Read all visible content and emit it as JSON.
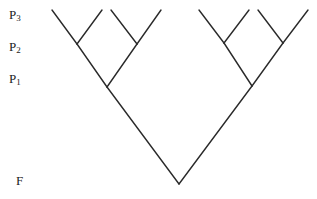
{
  "diagram": {
    "type": "binary-tree",
    "line_color": "#2a2a2a",
    "labels": [
      {
        "id": "p3",
        "base": "P",
        "sub": "3",
        "x": 9,
        "y": 8
      },
      {
        "id": "p2",
        "base": "P",
        "sub": "2",
        "x": 9,
        "y": 40
      },
      {
        "id": "p1",
        "base": "P",
        "sub": "1",
        "x": 9,
        "y": 72
      },
      {
        "id": "f",
        "base": "F",
        "sub": "",
        "x": 16,
        "y": 174
      }
    ],
    "nodes": {
      "root": [
        179,
        184
      ],
      "p1_left": [
        107,
        87
      ],
      "p1_right": [
        252,
        86
      ],
      "p2_ll": [
        77,
        44
      ],
      "p2_lr": [
        137,
        44
      ],
      "p2_rl": [
        224,
        43
      ],
      "p2_rr": [
        283,
        43
      ],
      "leaves": [
        [
          52,
          10
        ],
        [
          102,
          10
        ],
        [
          111,
          10
        ],
        [
          161,
          10
        ],
        [
          199,
          10
        ],
        [
          249,
          10
        ],
        [
          258,
          10
        ],
        [
          308,
          10
        ]
      ]
    }
  }
}
